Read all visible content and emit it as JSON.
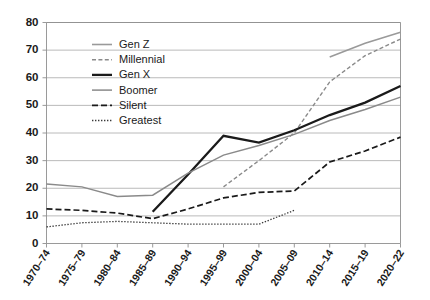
{
  "chart_data": {
    "type": "line",
    "title": "",
    "subtitle": "",
    "xlabel": "",
    "ylabel": "",
    "xlim_categories": [
      "1970–74",
      "1975–79",
      "1980–84",
      "1985–89",
      "1990–94",
      "1995–99",
      "2000–04",
      "2005–09",
      "2010–14",
      "2015–19",
      "2020–22"
    ],
    "ylim": [
      0,
      80
    ],
    "ytick_step": 10,
    "yticks": [
      0,
      10,
      20,
      30,
      40,
      50,
      60,
      70,
      80
    ],
    "ytick_labels": [
      "0",
      "10",
      "20",
      "30",
      "40",
      "50",
      "60",
      "70",
      "80"
    ],
    "grid": true,
    "grid_axis": "y",
    "legend_position": "top-left-inside",
    "categories": [
      "1970–74",
      "1975–79",
      "1980–84",
      "1985–89",
      "1990–94",
      "1995–99",
      "2000–04",
      "2005–09",
      "2010–14",
      "2015–19",
      "2020–22"
    ],
    "series": [
      {
        "name": "Gen Z",
        "style": "solid",
        "color": "#9a9a9a",
        "width": 1.6,
        "values": [
          null,
          null,
          null,
          null,
          null,
          null,
          null,
          null,
          67.5,
          72.5,
          76.5
        ]
      },
      {
        "name": "Millennial",
        "style": "dashed-fine",
        "color": "#8a8a8a",
        "width": 1.4,
        "values": [
          null,
          null,
          null,
          null,
          null,
          20.5,
          30.0,
          40.0,
          58.5,
          68.0,
          74.0
        ]
      },
      {
        "name": "Gen X",
        "style": "solid",
        "color": "#1a1a1a",
        "width": 2.3,
        "values": [
          null,
          null,
          null,
          11.5,
          25.0,
          39.0,
          36.5,
          41.0,
          46.5,
          51.0,
          57.0
        ]
      },
      {
        "name": "Boomer",
        "style": "solid",
        "color": "#8a8a8a",
        "width": 1.5,
        "values": [
          21.5,
          20.5,
          17.0,
          17.5,
          25.5,
          32.0,
          35.5,
          39.5,
          44.5,
          48.5,
          53.0
        ]
      },
      {
        "name": "Silent",
        "style": "dashed",
        "color": "#1a1a1a",
        "width": 1.7,
        "values": [
          12.5,
          12.0,
          11.0,
          9.0,
          12.5,
          16.5,
          18.5,
          19.0,
          29.5,
          33.5,
          38.5
        ]
      },
      {
        "name": "Greatest",
        "style": "dotted",
        "color": "#3a3a3a",
        "width": 1.3,
        "values": [
          6.0,
          7.5,
          8.0,
          7.5,
          7.0,
          7.0,
          7.0,
          12.0,
          null,
          null,
          null
        ]
      }
    ]
  },
  "legend": {
    "entries": [
      {
        "label": "Gen Z"
      },
      {
        "label": "Millennial"
      },
      {
        "label": "Gen X"
      },
      {
        "label": "Boomer"
      },
      {
        "label": "Silent"
      },
      {
        "label": "Greatest"
      }
    ]
  },
  "colors": {
    "background": "#ffffff",
    "grid": "#a8a8a8",
    "axis": "#8f8f8f",
    "text": "#1a1a1a",
    "accent_dark": "#1a1a1a",
    "accent_gray": "#8a8a8a"
  }
}
